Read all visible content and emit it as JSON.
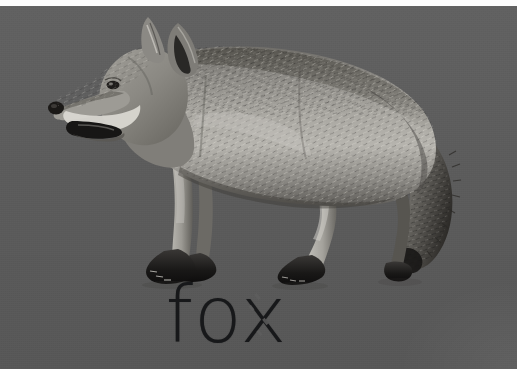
{
  "card": {
    "kind": "vocabulary-flashcard",
    "caption": "fox",
    "background_color": "#5c5c5c",
    "caption_color": "#17181a",
    "top_strip_color": "#fdfdfd"
  },
  "photo": {
    "subject": "fox",
    "alt_text": "Grayscale photograph of a fox standing in profile, facing left, mouth open, bushy tail hanging down",
    "rendering": "grayscale",
    "orientation": "facing-left",
    "palette": {
      "fur_light": "#b9b7b2",
      "fur_mid": "#8a8884",
      "fur_dark": "#4a4845",
      "fur_darkest": "#221f1d",
      "chest_white": "#d9d7d2",
      "paw_black": "#141414",
      "nose_black": "#1a1818",
      "eye": "#2a2724"
    },
    "parts": [
      "left-ear",
      "right-ear",
      "muzzle",
      "open-mouth",
      "nose",
      "eye",
      "neck",
      "back",
      "flank",
      "front-legs",
      "hind-legs",
      "front-paws",
      "hind-paws",
      "tail"
    ]
  },
  "artifacts": {
    "x_letter_dash_breaks": 4,
    "scan_noise": true,
    "corner_wash": "bottom-right"
  }
}
